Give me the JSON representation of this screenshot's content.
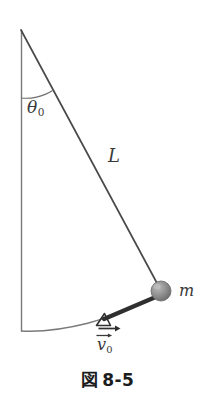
{
  "figure": {
    "caption_symbol": "図",
    "caption_number": "8-5",
    "caption_full": "図 8-5",
    "background_color": "#ffffff",
    "ink_color": "#3a3a3a",
    "caption_color": "#1c1c1c"
  },
  "labels": {
    "angle": {
      "symbol": "θ",
      "subscript": "0",
      "text": "θ₀"
    },
    "length": {
      "symbol": "L",
      "text": "L"
    },
    "mass": {
      "symbol": "m",
      "text": "m"
    },
    "velocity": {
      "symbol": "v",
      "subscript": "0",
      "text": "v₀",
      "has_vector_arrow": true
    }
  },
  "diagram": {
    "type": "pendulum-schematic",
    "pivot": {
      "x": 21,
      "y": 30
    },
    "bob": {
      "x": 161,
      "y": 291,
      "radius": 10,
      "color": "#8d8d8d"
    },
    "vertical_line": {
      "x": 21,
      "y1": 30,
      "y2": 331
    },
    "string": {
      "x1": 21,
      "y1": 30,
      "x2": 161,
      "y2": 291
    },
    "arc_swing": {
      "from_x": 21,
      "from_y": 331,
      "to_x": 161,
      "to_y": 291
    },
    "angle_arc": {
      "radius": 68,
      "from_deg": 90,
      "to_deg": 62
    },
    "velocity_vector": {
      "x1": 161,
      "y1": 291,
      "x2": 102,
      "y2": 320,
      "arrowhead": "open-triangle"
    },
    "velocity_horizontal_arrow": {
      "x1": 99,
      "y1": 328,
      "x2": 119,
      "y2": 328
    }
  },
  "icons": {
    "bob": "sphere-icon",
    "arrowhead": "triangle-arrowhead-icon",
    "vector-arrow": "vector-arrow-icon"
  }
}
